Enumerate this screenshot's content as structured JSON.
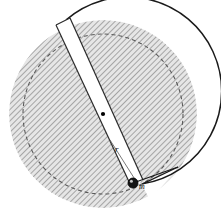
{
  "figure": {
    "type": "mechanics-diagram",
    "background_color": "#ffffff",
    "labels": [
      {
        "id": "mass",
        "text": "m",
        "x": 139,
        "y": 189,
        "font_size": 8,
        "description": "mass of ball in slot"
      },
      {
        "id": "radius",
        "text": "r",
        "x": 115,
        "y": 152,
        "font_size": 9,
        "description": "radial distance of ball from disk center"
      }
    ],
    "disk": {
      "center_x": 103,
      "center_y": 114,
      "outer_radius": 94,
      "inner_dashed_radius": 80,
      "fill_color": "#d9d9d9",
      "hatch_color": "#8c8c8c",
      "outline_color": "#1a1a1a",
      "outline_width": 1.4,
      "dashed_color": "#5a5a5a",
      "dash_pattern": "4 3"
    },
    "slot": {
      "description": "white radial slot cut through disk from upper-left rim to lower-right",
      "fill_color": "#ffffff",
      "edge_color": "#2a2a2a",
      "top_outer_x": 63,
      "top_outer_y": 30,
      "bottom_inner_x": 136,
      "bottom_inner_y": 184,
      "top_half_width": 7,
      "bottom_half_width": 3
    },
    "center_dot": {
      "x": 103,
      "y": 114,
      "radius": 2.1,
      "color": "#000000",
      "description": "axis of rotation at disk center"
    },
    "ball": {
      "x": 133,
      "y": 183,
      "radius": 5.0,
      "fill_color": "#141414",
      "highlight_color": "#c8c8c8",
      "ring_color": "#000000",
      "description": "small ball of mass m sliding in the slot"
    },
    "wedge_cut": {
      "description": "notch removed from disk rim between slot and lower-right radial cut",
      "start_angle_deg": 64,
      "end_angle_deg": 79
    }
  }
}
